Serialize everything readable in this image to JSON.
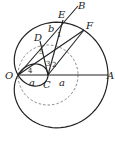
{
  "diagram": {
    "points": {
      "O": "O",
      "A": "A",
      "B": "B",
      "C": "C",
      "D": "D",
      "E": "E",
      "F": "F"
    },
    "segment_labels": {
      "OC": "a",
      "CA": "a",
      "DE": "b"
    },
    "angle_labels": [
      "1",
      "2",
      "3",
      "4",
      "5"
    ],
    "curves": {
      "outer": "limaçon with pole O",
      "inner": "dashed circle centered at C"
    }
  }
}
